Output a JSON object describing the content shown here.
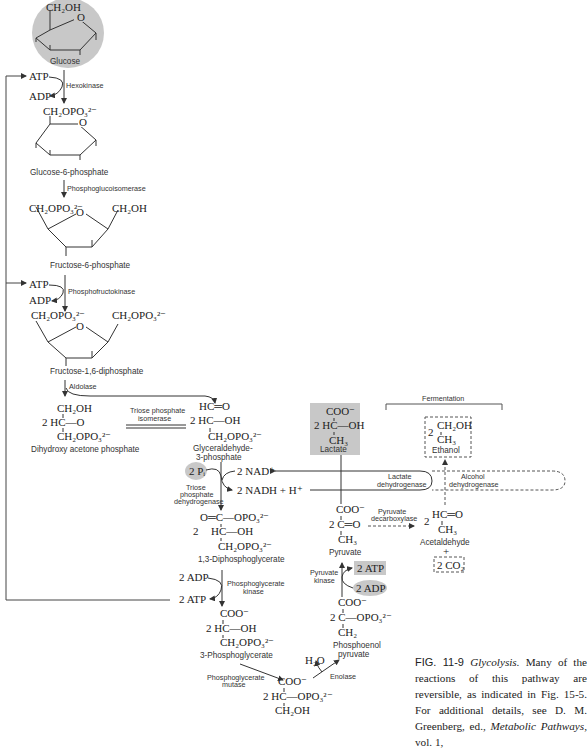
{
  "glucose": {
    "group": "CH₂OH",
    "name": "Glucose"
  },
  "hexokinase_step": {
    "atp": "ATP",
    "adp": "ADP",
    "enzyme": "Hexokinase"
  },
  "g6p": {
    "group": "CH₂OPO₃²⁻",
    "name": "Glucose-6-phosphate"
  },
  "pgi_step": {
    "enzyme": "Phosphoglucoisomerase"
  },
  "f6p": {
    "group_left": "CH₂OPO₃²⁻",
    "group_right": "CH₂OH",
    "name": "Fructose-6-phosphate"
  },
  "pfk_step": {
    "atp": "ATP",
    "adp": "ADP",
    "enzyme": "Phosphofructokinase"
  },
  "f16dp": {
    "group_left": "CH₂OPO₃²⁻",
    "group_right": "CH₂OPO₃²⁻",
    "name": "Fructose-1,6-diphosphate"
  },
  "aldolase_step": {
    "enzyme": "Aldolase"
  },
  "dhap": {
    "line1": "CH₂OH",
    "line2": "2 HC—O",
    "line3": "CH₂OPO₃²⁻",
    "name": "Dihydroxy acetone phosphate"
  },
  "tpi_step": {
    "enzyme_line1": "Triose phosphate",
    "enzyme_line2": "isomerase"
  },
  "g3p": {
    "line1": "HC═O",
    "line2": "2  HC—OH",
    "line3": "CH₂OPO₃²⁻",
    "name_line1": "Glyceraldehyde-",
    "name_line2": "3-phosphate"
  },
  "gapdh_step": {
    "pi": "2 Pᵢ",
    "nad": "2 NAD⁺",
    "nadh": "2 NADH + H⁺",
    "enzyme_line1": "Triose",
    "enzyme_line2": "phosphate",
    "enzyme_line3": "dehydrogenase"
  },
  "dpg13": {
    "line1": "O═C—OPO₃²⁻",
    "coef": "2",
    "line2": "HC—OH",
    "line3": "CH₂OPO₃²⁻",
    "name": "1,3-Diphosphoglycerate"
  },
  "pgk_step": {
    "adp": "2 ADP",
    "atp": "2 ATP",
    "enzyme_line1": "Phosphoglycerate",
    "enzyme_line2": "kinase"
  },
  "pg3": {
    "line1": "COO⁻",
    "line2": "2 HC—OH",
    "line3": "CH₂OPO₃²⁻",
    "name": "3-Phosphoglycerate"
  },
  "pgm_step": {
    "enzyme_line1": "Phosphoglycerate",
    "enzyme_line2": "mutase"
  },
  "pg2": {
    "line1": "COO⁻",
    "line2": "2 HC—OPO₃²⁻",
    "line3": "CH₂OH"
  },
  "enolase_step": {
    "water": "H₂O",
    "enzyme": "Enolase"
  },
  "pep": {
    "line1": "COO⁻",
    "line2": "2 C—OPO₃²⁻",
    "line3": "CH₂",
    "name_line1": "Phosphoenol",
    "name_line2": "pyruvate"
  },
  "pk_step": {
    "atp": "2 ATP",
    "adp": "2 ADP",
    "enzyme_line1": "Pyruvate",
    "enzyme_line2": "kinase"
  },
  "pyruvate": {
    "line1": "COO⁻",
    "line2": "2 C═O",
    "line3": "CH₃",
    "name": "Pyruvate"
  },
  "lactate": {
    "line1": "COO⁻",
    "line2": "2 HC—OH",
    "line3": "CH₃",
    "name": "Lactate"
  },
  "ldh_step": {
    "enzyme_line1": "Lactate",
    "enzyme_line2": "dehydrogenase"
  },
  "fermentation": {
    "label": "Fermentation"
  },
  "pdc_step": {
    "enzyme_line1": "Pyruvate",
    "enzyme_line2": "decarboxylase"
  },
  "acetaldehyde": {
    "coef": "2",
    "line1": "HC═O",
    "line2": "CH₃",
    "name": "Acetaldehyde",
    "plus": "+",
    "co2": "2 CO₂"
  },
  "adh_step": {
    "enzyme_line1": "Alcohol",
    "enzyme_line2": "dehydrogenase"
  },
  "ethanol": {
    "coef": "2",
    "line1": "CH₂OH",
    "line2": "CH₃",
    "name": "Ethanol"
  },
  "caption": {
    "fig": "FIG. 11-9",
    "title": "Glycolysis.",
    "text1": " Many of the reactions of this pathway are reversible, as indicated in Fig. 15-5. For additional details, see D. M. Greenberg, ed., ",
    "book": "Metabolic Pathways,",
    "text2": " vol. 1,"
  },
  "colors": {
    "highlight": "#c8c8c8",
    "line": "#333333"
  }
}
